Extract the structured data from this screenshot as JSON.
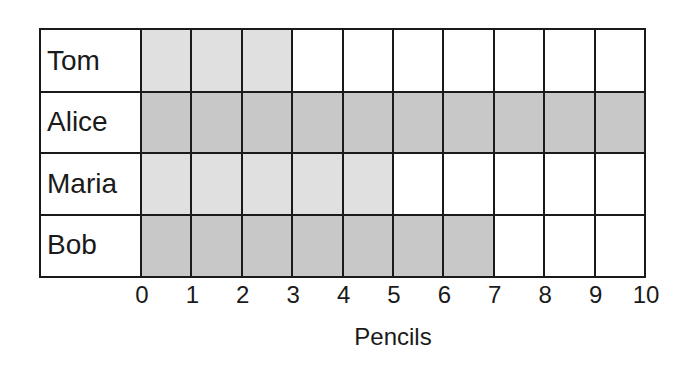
{
  "chart_data": {
    "type": "bar",
    "orientation": "horizontal",
    "style": "pictograph-grid",
    "title": "",
    "categories": [
      "Tom",
      "Alice",
      "Maria",
      "Bob"
    ],
    "values": [
      3,
      10,
      5,
      7
    ],
    "xlabel": "Pencils",
    "ylabel": "",
    "xlim": [
      0,
      10
    ],
    "x_ticks": [
      "0",
      "1",
      "2",
      "3",
      "4",
      "5",
      "6",
      "7",
      "8",
      "9",
      "10"
    ],
    "grid": true,
    "legend": null,
    "bar_colors": [
      "#e0e0e0",
      "#c8c8c8",
      "#e0e0e0",
      "#c8c8c8"
    ]
  },
  "colors": {
    "light_fill": "#e0e0e0",
    "dark_fill": "#c8c8c8",
    "empty_fill": "#ffffff",
    "grid_line": "#1a1a1a"
  }
}
